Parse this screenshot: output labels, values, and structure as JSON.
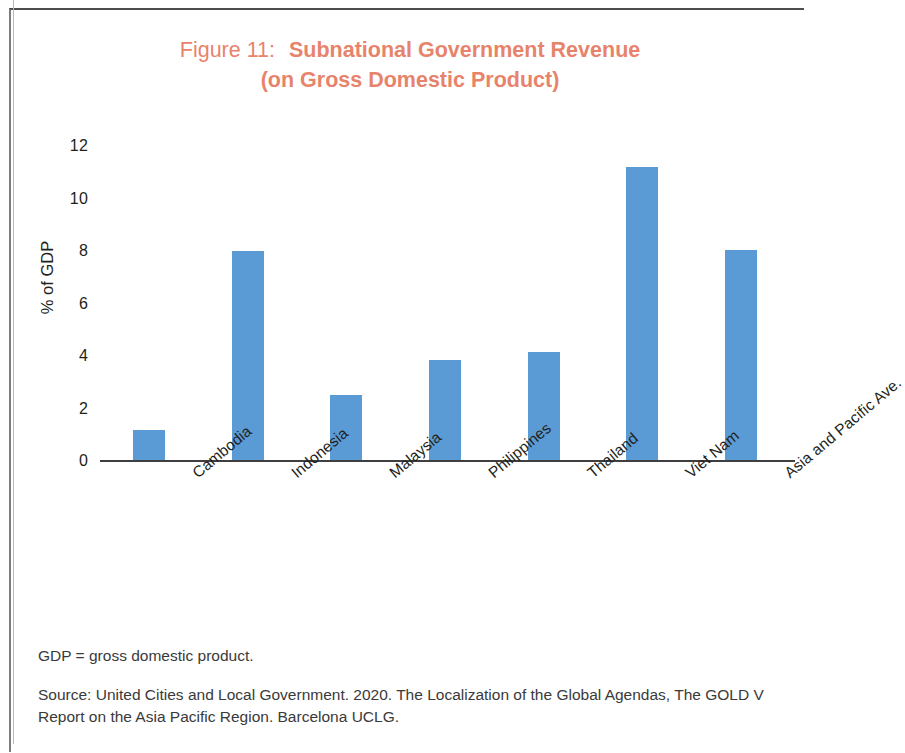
{
  "title": {
    "figure_label": "Figure 11:",
    "figure_name": "Subnational Government Revenue",
    "subtitle": "(on Gross Domestic Product)",
    "color": "#E8836B"
  },
  "notes": {
    "abbreviation": "GDP = gross domestic product.",
    "source": "Source: United Cities and Local Government. 2020. The Localization of the Global Agendas, The GOLD V Report on the Asia Pacific Region. Barcelona UCLG."
  },
  "chart_data": {
    "type": "bar",
    "xlabel": "",
    "ylabel": "% of GDP",
    "ylim": [
      0,
      12
    ],
    "ytick_step": 2,
    "yticks": [
      "12",
      "10",
      "8",
      "6",
      "4",
      "2",
      "0"
    ],
    "grid": false,
    "legend": false,
    "bar_color": "#5B9BD5",
    "categories": [
      "Cambodia",
      "Indonesia",
      "Malaysia",
      "Philippines",
      "Thailand",
      "Viet Nam",
      "Asia and Pacific Ave."
    ],
    "values": [
      1.2,
      8.0,
      2.5,
      3.85,
      4.15,
      11.2,
      8.05
    ]
  }
}
